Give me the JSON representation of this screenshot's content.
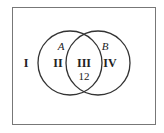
{
  "diagram": {
    "type": "venn",
    "sets": [
      {
        "name": "A"
      },
      {
        "name": "B"
      }
    ],
    "regions": [
      {
        "id": "universe-outside",
        "label": "I",
        "value": null
      },
      {
        "id": "a-only",
        "label": "II",
        "value": null
      },
      {
        "id": "a-and-b",
        "label": "III",
        "value": "12"
      },
      {
        "id": "b-only",
        "label": "IV",
        "value": null
      }
    ],
    "colors": {
      "stroke": "#333333",
      "frame": "#777777",
      "text": "#222222"
    }
  }
}
